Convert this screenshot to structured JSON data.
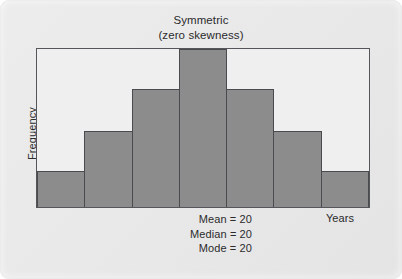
{
  "chart_data": {
    "type": "bar",
    "title": "Symmetric",
    "subtitle": "(zero skewness)",
    "xlabel": "Years",
    "ylabel": "Frequency",
    "grid": false,
    "legend": null,
    "axis_ticks": [],
    "ylim": [
      0,
      100
    ],
    "categories": [
      "1",
      "2",
      "3",
      "4",
      "5",
      "6",
      "7"
    ],
    "values": [
      17.5,
      37.5,
      58,
      77.5,
      58,
      37.5,
      17.5
    ],
    "bar_color": "#8c8c8c",
    "bar_edge_color": "#4a4b4e",
    "plot_background": "#efefef",
    "frame_color": "#55565a",
    "annotations": [
      {
        "label": "Mean = 20"
      },
      {
        "label": "Median = 20"
      },
      {
        "label": "Mode = 20"
      }
    ]
  },
  "figure": {
    "title_line1": "Symmetric",
    "title_line2": "(zero skewness)",
    "y_axis_label": "Frequency",
    "x_axis_label": "Years",
    "stat_mean": "Mean = 20",
    "stat_median": "Median = 20",
    "stat_mode": "Mode = 20"
  },
  "colors": {
    "card_background": "#e9e9ea",
    "bar_fill": "#8c8c8c",
    "bar_edge": "#4a4b4e",
    "plot_fill": "#efefef",
    "frame": "#55565a",
    "text": "#2b2b2b"
  }
}
